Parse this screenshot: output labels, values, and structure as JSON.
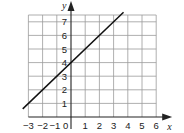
{
  "chart_data": {
    "type": "line",
    "title": "",
    "xlabel": "x",
    "ylabel": "y",
    "xlim": [
      -3,
      6
    ],
    "ylim": [
      0,
      7.5
    ],
    "grid": true,
    "x_ticks": [
      -3,
      -2,
      -1,
      0,
      1,
      2,
      3,
      4,
      5,
      6
    ],
    "x_tick_labels": [
      "−3",
      "−2",
      "−1",
      "0",
      "1",
      "2",
      "3",
      "4",
      "5",
      "6"
    ],
    "y_ticks": [
      1,
      2,
      3,
      4,
      5,
      6,
      7
    ],
    "y_tick_labels": [
      "1",
      "2",
      "3",
      "4",
      "5",
      "6",
      "7"
    ],
    "series": [
      {
        "name": "y = x + 4",
        "x": [
          -3.4,
          3.7
        ],
        "y": [
          0.6,
          7.7
        ],
        "points": [
          [
            -3,
            1
          ],
          [
            -2,
            2
          ],
          [
            -1,
            3
          ],
          [
            0,
            4
          ],
          [
            1,
            5
          ],
          [
            2,
            6
          ],
          [
            3,
            7
          ]
        ]
      }
    ],
    "legend": "none"
  }
}
